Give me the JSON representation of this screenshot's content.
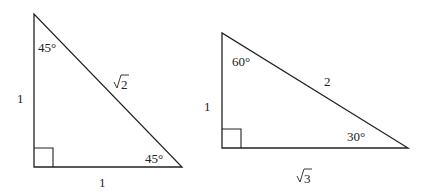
{
  "diagram": {
    "triangles": [
      {
        "name": "45-45-90 triangle",
        "angles": {
          "top": "45°",
          "bottom_right": "45°"
        },
        "sides": {
          "left": "1",
          "bottom": "1",
          "hypotenuse_radicand": "2"
        },
        "right_angle": "bottom-left"
      },
      {
        "name": "30-60-90 triangle",
        "angles": {
          "top": "60°",
          "bottom_right": "30°"
        },
        "sides": {
          "left": "1",
          "bottom_radicand": "3",
          "hypotenuse": "2"
        },
        "right_angle": "bottom-left"
      }
    ],
    "colors": {
      "stroke": "#222222",
      "background": "#ffffff"
    }
  }
}
